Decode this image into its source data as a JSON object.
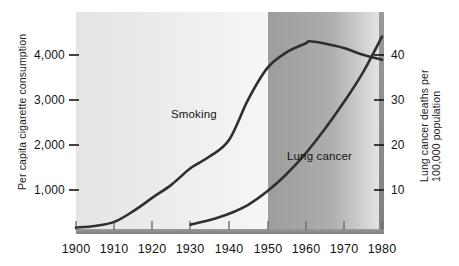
{
  "chart_data": {
    "type": "line",
    "title": "",
    "subtitle": "",
    "xlabel": "",
    "x_tick_labels": [
      "1900",
      "1910",
      "1920",
      "1930",
      "1940",
      "1950",
      "1960",
      "1970",
      "1980"
    ],
    "x_tick_values": [
      1900,
      1910,
      1920,
      1930,
      1940,
      1950,
      1960,
      1970,
      1980
    ],
    "xlim": [
      1900,
      1980
    ],
    "grid": false,
    "legend_position": "inline-annotations",
    "axes": [
      {
        "id": "left",
        "label": "Per capita cigarette consumption",
        "tick_labels": [
          "1,000",
          "2,000",
          "3,000",
          "4,000"
        ],
        "tick_values": [
          1000,
          2000,
          3000,
          4000
        ],
        "ylim": [
          0,
          4850
        ]
      },
      {
        "id": "right",
        "label": "Lung cancer deaths per 100,000 population",
        "tick_labels": [
          "10",
          "20",
          "30",
          "40"
        ],
        "tick_values": [
          10,
          20,
          30,
          40
        ],
        "ylim": [
          0,
          48.5
        ]
      }
    ],
    "series": [
      {
        "name": "Smoking",
        "axis": "left",
        "annotation": "Smoking",
        "color": "#2f2f2f",
        "x": [
          1900,
          1905,
          1910,
          1915,
          1920,
          1925,
          1930,
          1935,
          1940,
          1945,
          1950,
          1955,
          1960,
          1961,
          1965,
          1970,
          1975,
          1980
        ],
        "values": [
          55,
          90,
          180,
          420,
          720,
          1010,
          1380,
          1640,
          2000,
          2900,
          3600,
          3950,
          4150,
          4200,
          4150,
          4050,
          3900,
          3790
        ]
      },
      {
        "name": "Lung cancer",
        "axis": "right",
        "annotation": "Lung cancer",
        "color": "#2f2f2f",
        "x": [
          1930,
          1935,
          1940,
          1945,
          1950,
          1955,
          1960,
          1965,
          1970,
          1975,
          1980
        ],
        "values": [
          1.2,
          2.2,
          3.6,
          5.6,
          8.6,
          12.4,
          17.0,
          22.4,
          28.4,
          35.0,
          43.0
        ]
      }
    ],
    "shaded_band": {
      "from": 1950,
      "to": 1980,
      "note": "darker background panel beginning at 1950"
    }
  },
  "colors": {
    "curve": "#2f2f2f",
    "frame": "#8a8a8a",
    "panel_light": "#ededed",
    "panel_dark": "#a3a3a3",
    "text": "#141414"
  }
}
